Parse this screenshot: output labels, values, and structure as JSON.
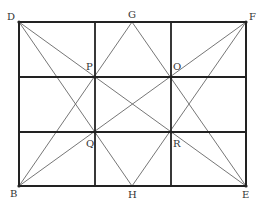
{
  "diagram": {
    "colors": {
      "frame": "#222222",
      "thin": "#666666",
      "label": "#333333"
    },
    "points": {
      "D": {
        "x": 19,
        "y": 22,
        "label": "D"
      },
      "G": {
        "x": 132,
        "y": 22,
        "label": "G"
      },
      "F": {
        "x": 246,
        "y": 22,
        "label": "F"
      },
      "B": {
        "x": 19,
        "y": 186,
        "label": "B"
      },
      "H": {
        "x": 132,
        "y": 186,
        "label": "H"
      },
      "E": {
        "x": 246,
        "y": 186,
        "label": "E"
      },
      "P": {
        "x": 95,
        "y": 77,
        "label": "P"
      },
      "O": {
        "x": 171,
        "y": 77,
        "label": "O"
      },
      "Q": {
        "x": 95,
        "y": 132,
        "label": "Q"
      },
      "R": {
        "x": 171,
        "y": 132,
        "label": "R"
      }
    },
    "grid": {
      "x_lines": [
        95,
        171
      ],
      "y_lines": [
        77,
        132
      ]
    },
    "segments": [
      [
        "D",
        "E"
      ],
      [
        "B",
        "F"
      ],
      [
        "G",
        "B"
      ],
      [
        "G",
        "E"
      ],
      [
        "H",
        "D"
      ],
      [
        "H",
        "F"
      ]
    ]
  }
}
